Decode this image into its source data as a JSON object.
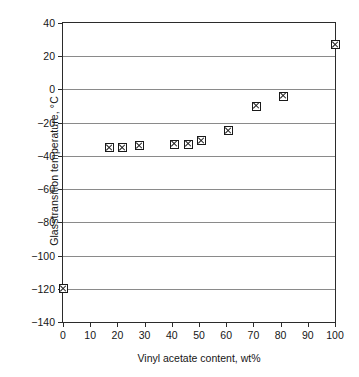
{
  "chart_data": {
    "type": "scatter",
    "title": "",
    "xlabel": "Vinyl acetate content, wt%",
    "ylabel": "Glasstransition temperature, °C",
    "xlim": [
      0,
      100
    ],
    "ylim": [
      -140,
      40
    ],
    "xticks": [
      0,
      10,
      20,
      30,
      40,
      50,
      60,
      70,
      80,
      90,
      100
    ],
    "yticks": [
      40,
      20,
      0,
      -20,
      -40,
      -60,
      -80,
      -100,
      -120,
      -140
    ],
    "xtick_labels": [
      "0",
      "10",
      "20",
      "30",
      "40",
      "50",
      "60",
      "70",
      "80",
      "90",
      "100"
    ],
    "ytick_labels": [
      "40",
      "20",
      "0",
      "−20",
      "−40",
      "−60",
      "−80",
      "−100",
      "−120",
      "−140"
    ],
    "grid": "horizontal",
    "legend": "none",
    "marker": "square-with-x",
    "series": [
      {
        "name": "Glass transition temperature",
        "x": [
          0,
          17,
          22,
          28,
          41,
          46,
          51,
          61,
          71,
          81,
          100
        ],
        "y": [
          -120,
          -35,
          -35,
          -34,
          -33,
          -33,
          -31,
          -25,
          -10,
          -4,
          27
        ]
      }
    ]
  },
  "colors": {
    "axis": "#2b2b2b",
    "grid": "#8a8a8a",
    "marker_edge": "#1a1a1a",
    "marker_face": "#ffffff",
    "background": "#ffffff",
    "text": "#161616"
  }
}
